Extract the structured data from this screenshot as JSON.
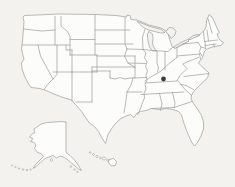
{
  "window": {
    "width": 235,
    "height": 187,
    "background": "#f3f2ee"
  },
  "map": {
    "title": "United States map",
    "land_fill": "#fcfcfa",
    "water_fill": "#f3f2ee",
    "line_color": "#9c9c9a",
    "line_width": 0.7,
    "marker": {
      "region": "Kentucky",
      "x": 163.5,
      "y": 79,
      "r": 2.4,
      "color": "#3d3d3d"
    },
    "shapes": [
      {
        "name": "contiguous-us-outline",
        "type": "path",
        "fill": "land",
        "d": "M25,15.5 L60,14 L96,14.5 L116,15.5 L126.5,17 L127,15 L130,15.5 L131,19.5 L137,20 L143,22.5 L149,25 L155,26.5 L161,28 L166,31 L168,34 L169.5,39 L171,43.5 L172.5,47.5 L177,47.5 L182,45 L186.5,42.5 L188.5,40 L193,37.5 L197.5,36.5 L201,33.5 L204.5,30 L206,27 L206.5,21 L209,14.5 L212,17 L214.5,22 L217,28 L219.5,32.5 L217,34 L218.5,38 L221,41 L223.5,42.5 L221,45.5 L214,46.5 L208,48.5 L205,50.5 L203.5,54 L202,58.5 L200,60.5 L198.5,63 L201,65.5 L204.5,69 L208.5,72.5 L208,77 L204,81.5 L199,86 L194.5,90.5 L191.5,95 L191,99 L193.5,103.5 L197.5,109 L201.5,115.5 L203.5,122 L203.5,129 L201,136 L197.5,142.5 L194.5,146 L192,143 L190,138.5 L186.5,130.5 L183.5,122 L181.5,115 L178.5,111.5 L173,109.5 L166.5,108.5 L159.5,109.5 L151.5,108.5 L146,110.5 L140.5,111.5 L136.5,113.5 L134,117.5 L130.5,114.5 L126,116 L121,118.5 L116.5,122.5 L112,128 L108,134.5 L105.5,143.5 L102.5,139 L98.5,131.5 L94.5,126.5 L89.5,123 L85.5,117.5 L81.5,111.5 L76.5,105.5 L74,103 L71.5,100 L63,97.5 L54,94 L46,90.5 L40,88.5 L31,87.5 L28,83 L24.5,76 L22,68.5 L21.5,63 L24,59 L22.5,53.5 L21.5,48.5 L22.5,42 L23,35 L23.5,28 L24,21.5 L23,17.5 Z"
      },
      {
        "name": "lake-superior",
        "type": "path",
        "fill": "water",
        "d": "M137.5,21.5 L144,24 L150,26.5 L156,28 L161.5,29.5 L165,32.5 L160.5,33 L154.5,31.5 L148.5,30 L143.5,27.5 L140,24.5 Z"
      },
      {
        "name": "lake-michigan",
        "type": "path",
        "fill": "water",
        "d": "M149,31.5 L152.5,34 L153,39 L152.5,44 L154.5,48.5 L156.5,51 L152.5,51 L149.5,47 L148,41 L147.5,35 Z"
      },
      {
        "name": "lake-huron",
        "type": "path",
        "fill": "water",
        "d": "M166,31.5 L169,27.5 L173.5,28 L176,31.5 L174.5,35.5 L171,38.5 L169,35 L167,33 Z"
      },
      {
        "name": "lake-erie",
        "type": "path",
        "fill": "water",
        "d": "M174,46.5 L178.5,44 L183,41.5 L187.5,39.5 L189,41 L184,43.5 L179,46 L175,48.5 Z"
      },
      {
        "name": "lake-ontario",
        "type": "path",
        "fill": "water",
        "d": "M188.5,39 L192.5,36 L197,34.5 L200,35 L195.5,37 L190.5,39.5 Z"
      },
      {
        "name": "state-borders",
        "type": "path",
        "fill": "none",
        "d": "M24,29 L42,31 L55,30 M55,16.5 L55,45 M22,45 L70,45 M61,16.5 L61,26 L67,31 L70,36 L70,55 M70,39.5 L95,39.5 M95,15 L95,55 M95,30 L130,30 M95,44 L133,44 M70,55 L97,55 M66,45 L66,50 L72,50 M72,50 L72,72 M57,45 L57,72 M38,45 L40.5,56 L53,79 M57,72 L57,74.5 L53,79 M53,79 L48.5,83.5 L44,89.5 M53,72 L97,72 M72,72 L72,101 M97,55 L97,72 M92,72 L92,102 M76,102 L92,102 M97,56 L135,56 M92,67 L135,67 M92,67 L92,72 M92,71 L110,71 M110,71 L110,78 M110,78 L115,79 L120,77.5 L125,79 L130,78 L133,78 M135,56 L135,78 M133,78 L131,85 L127,92 L126,100 L125,107 L124,113 M127,92 L142,92 M133,78 L146,77.5 M125,17.5 L125,44 L127,49 M127,49 L143,49.5 M127,49 L124.5,56 L128,63 M128,63 L145.5,63.5 M128,63 L134,66.5 L135,68 M143,49.5 L146,53 L144.5,57.5 L147,62 L145.5,66.5 L147.5,71 L146,75.5 L147,80 L145,84.5 L146,89 L144,93.5 L144.5,98 L142.5,102.5 L141,107 L139.5,111 L137.5,114.5 M145,29.5 L142.5,37 L143,49.5 M143,49.5 L152.5,50.5 M152.5,50.5 L168,51.5 L172,48 M157,51 L157,63 L158.5,68 L157.5,72 M165,51.5 L165,70 M177,57.5 L173,60.5 L169,63.5 L165,67.5 L161,71 L157,73.5 L152.5,76 L148.5,78.5 L145,81 M145,83 L177,81 M177,47.5 L177,57.5 M183,44 L198,42.5 M177,56 L200,54 M198,42.5 L201,47 L199.5,51.5 L201.5,55.5 M199.5,54 L200.5,59.5 M198.5,57.5 L193.5,59.5 L188,61.5 L183,64 M183,64 L187,68.5 L180,75.5 L177,80.5 M209,73.5 L184,76.5 M178,80.8 L181,84.5 M193.5,89.5 L186,85.5 L181,84.5 M181,84.5 L185,89.5 L189,93 L191.5,95.5 M141,94.5 L184,92 M172.5,92.5 L175,103.5 L174,108 M159.5,93.5 L162,104 L160.5,110.5 M151.5,108.5 L174,107.5 L186,103.5 L192,101.5 M203.5,31.5 L204.5,41.5 M207,30 L208.5,41 M208,18.5 L212,33 M204.5,41.5 L217.5,40 M205,45.5 L216,44 M205,41.8 L205.5,48.5 M213.5,44.2 L214.5,47.2 M201,47 L205.5,48.5"
      },
      {
        "name": "alaska",
        "type": "path",
        "fill": "land",
        "d": "M37,127 L41,124 L47,122.5 L55,122 L61,121.5 L66,122 L66,152.5 L70,155.5 L73.5,159 L77.5,164 L81.5,170.5 L78.5,169 L75,166 L71.5,163 L68,160 L64.5,157.5 L60,156 L56.5,158 L53,155.5 L49,157 L45,158.5 L40.5,162.5 L36,166.5 L33,168.5 L35.5,164.5 L39.5,160.5 L43.5,156.5 L41,153.5 L37.5,152.5 L34.5,148.5 L36,145 L33.5,142 L30.5,141.5 L33,138.5 L29.5,137 L32,134 L35,132.5 L34,129.5 Z"
      },
      {
        "name": "aleutian-islands",
        "type": "dots",
        "points": [
          [
            12,
            165.5,
            0.6
          ],
          [
            15.5,
            167,
            0.7
          ],
          [
            19,
            168.5,
            0.7
          ],
          [
            23,
            169.5,
            0.8
          ],
          [
            27,
            170,
            0.8
          ],
          [
            30.5,
            169.5,
            0.7
          ]
        ]
      },
      {
        "name": "alaska-panhandle-islands",
        "type": "dots",
        "points": [
          [
            71,
            166.5,
            0.8
          ],
          [
            74.5,
            169.5,
            0.8
          ],
          [
            77.5,
            172,
            0.7
          ],
          [
            51.5,
            160,
            1.3
          ]
        ]
      },
      {
        "name": "hawaii-islands",
        "type": "dots",
        "points": [
          [
            90,
            152.5,
            0.8
          ],
          [
            93.5,
            154.5,
            1.0
          ],
          [
            97,
            156.5,
            1.1
          ],
          [
            100.5,
            158,
            0.9
          ],
          [
            104,
            158.5,
            1.5
          ],
          [
            107.5,
            160,
            1.0
          ]
        ]
      },
      {
        "name": "hawaii-big-island",
        "type": "path",
        "fill": "land",
        "d": "M109.5,159.5 L113.5,158.5 L116.5,161.5 L115.5,165.5 L111.5,166 L108.5,162.5 Z"
      }
    ]
  }
}
